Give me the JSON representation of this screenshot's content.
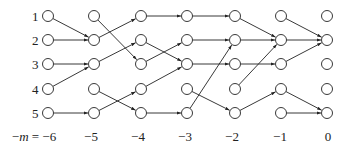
{
  "diagram": {
    "columns": [
      {
        "m": -6,
        "label": "−m = −6",
        "x": 48,
        "label_x": 34
      },
      {
        "m": -5,
        "label": "−5",
        "x": 94,
        "label_x": 91
      },
      {
        "m": -4,
        "label": "−4",
        "x": 141,
        "label_x": 138
      },
      {
        "m": -3,
        "label": "−3",
        "x": 187,
        "label_x": 185
      },
      {
        "m": -2,
        "label": "−2",
        "x": 235,
        "label_x": 232
      },
      {
        "m": -1,
        "label": "−1",
        "x": 281,
        "label_x": 280
      },
      {
        "m": 0,
        "label": "0",
        "x": 327,
        "label_x": 328
      }
    ],
    "rows": [
      {
        "label": "1",
        "y": 16
      },
      {
        "label": "2",
        "y": 40
      },
      {
        "label": "3",
        "y": 64
      },
      {
        "label": "4",
        "y": 89
      },
      {
        "label": "5",
        "y": 113
      }
    ],
    "label_y": 141,
    "edges": [
      [
        0,
        1,
        1,
        2
      ],
      [
        0,
        2,
        1,
        2
      ],
      [
        0,
        3,
        1,
        3
      ],
      [
        0,
        4,
        1,
        3
      ],
      [
        0,
        5,
        1,
        5
      ],
      [
        1,
        1,
        2,
        3
      ],
      [
        1,
        2,
        2,
        1
      ],
      [
        1,
        3,
        2,
        2
      ],
      [
        1,
        4,
        2,
        5
      ],
      [
        1,
        5,
        2,
        4
      ],
      [
        2,
        1,
        3,
        1
      ],
      [
        2,
        2,
        3,
        3
      ],
      [
        2,
        3,
        3,
        2
      ],
      [
        2,
        4,
        3,
        3
      ],
      [
        2,
        5,
        3,
        5
      ],
      [
        3,
        1,
        4,
        1
      ],
      [
        3,
        2,
        4,
        2
      ],
      [
        3,
        3,
        4,
        3
      ],
      [
        3,
        4,
        4,
        5
      ],
      [
        3,
        5,
        4,
        2
      ],
      [
        4,
        1,
        5,
        2
      ],
      [
        4,
        2,
        5,
        2
      ],
      [
        4,
        3,
        5,
        3
      ],
      [
        4,
        4,
        5,
        2
      ],
      [
        4,
        5,
        5,
        4
      ],
      [
        5,
        1,
        6,
        2
      ],
      [
        5,
        2,
        6,
        2
      ],
      [
        5,
        3,
        6,
        2
      ],
      [
        5,
        4,
        6,
        5
      ],
      [
        5,
        5,
        6,
        5
      ]
    ],
    "node_radius": 5.5,
    "stroke_color": "#222222"
  }
}
